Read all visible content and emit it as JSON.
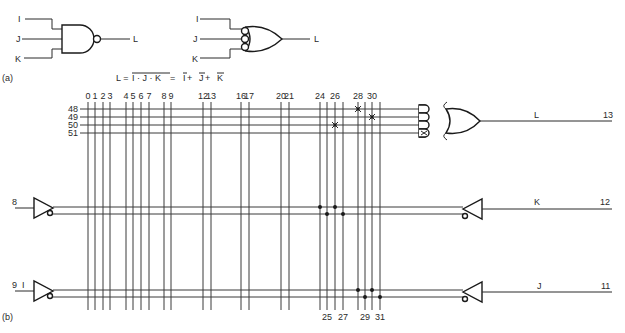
{
  "figure": {
    "part_a_label": "(a)",
    "part_b_label": "(b)",
    "equation": {
      "lhs": "L = ",
      "negated": "I · J · K",
      "rhs_prefix": " = ",
      "terms": [
        "I",
        " + ",
        "J",
        " + ",
        "K"
      ]
    },
    "nand_gate": {
      "inputs": [
        "I",
        "J",
        "K"
      ],
      "output": "L"
    },
    "or_gate_inverted_inputs": {
      "inputs": [
        "I",
        "J",
        "K"
      ],
      "output": "L"
    }
  },
  "pla": {
    "column_labels_top": [
      "0",
      "1",
      "2",
      "3",
      "4",
      "5",
      "6",
      "7",
      "8",
      "9",
      "12",
      "13",
      "16",
      "17",
      "20",
      "21",
      "24",
      "26",
      "28",
      "30"
    ],
    "column_labels_bottom": [
      "25",
      "27",
      "29",
      "31"
    ],
    "columns": [
      {
        "id": "0",
        "x": 88
      },
      {
        "id": "1",
        "x": 95
      },
      {
        "id": "2",
        "x": 103
      },
      {
        "id": "3",
        "x": 110
      },
      {
        "id": "4",
        "x": 126
      },
      {
        "id": "5",
        "x": 133
      },
      {
        "id": "6",
        "x": 141
      },
      {
        "id": "7",
        "x": 149
      },
      {
        "id": "8",
        "x": 164
      },
      {
        "id": "9",
        "x": 171
      },
      {
        "id": "12",
        "x": 203
      },
      {
        "id": "13",
        "x": 211
      },
      {
        "id": "16",
        "x": 241
      },
      {
        "id": "17",
        "x": 249
      },
      {
        "id": "20",
        "x": 281
      },
      {
        "id": "21",
        "x": 289
      },
      {
        "id": "24",
        "x": 320
      },
      {
        "id": "25",
        "x": 327
      },
      {
        "id": "26",
        "x": 335
      },
      {
        "id": "27",
        "x": 343
      },
      {
        "id": "28",
        "x": 358
      },
      {
        "id": "29",
        "x": 365
      },
      {
        "id": "30",
        "x": 372
      },
      {
        "id": "31",
        "x": 380
      }
    ],
    "product_rows": [
      {
        "id": "48",
        "y": 109
      },
      {
        "id": "49",
        "y": 117
      },
      {
        "id": "50",
        "y": 125
      },
      {
        "id": "51",
        "y": 133
      }
    ],
    "fuse_marks": [
      {
        "column": "28",
        "row": "48"
      },
      {
        "column": "30",
        "row": "49"
      },
      {
        "column": "26",
        "row": "50"
      }
    ],
    "or_output": {
      "signal": "L",
      "pin": "13"
    },
    "input_buffers": [
      {
        "pin": "8",
        "signal": "K",
        "name": "K",
        "y": 207,
        "y_bar": 214,
        "dots": [
          {
            "column": "24",
            "line": "true"
          },
          {
            "column": "25",
            "line": "comp"
          },
          {
            "column": "26",
            "line": "true"
          },
          {
            "column": "27",
            "line": "comp"
          }
        ],
        "output_signal": "K",
        "output_pin": "12"
      },
      {
        "pin": "9",
        "signal": "I",
        "name": "I",
        "y": 290,
        "y_bar": 297,
        "dots": [
          {
            "column": "28",
            "line": "true"
          },
          {
            "column": "29",
            "line": "comp"
          },
          {
            "column": "30",
            "line": "true"
          },
          {
            "column": "31",
            "line": "comp"
          }
        ],
        "output_signal": "J",
        "output_pin": "11"
      }
    ]
  },
  "colors": {
    "ink": "#2a2a2a",
    "background": "#ffffff"
  }
}
